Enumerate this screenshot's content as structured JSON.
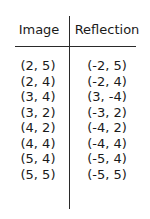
{
  "table": {
    "headers": [
      "Image",
      "Reflection"
    ],
    "rows": [
      {
        "image": "(2, 5)",
        "reflection": "(-2, 5)"
      },
      {
        "image": "(2, 4)",
        "reflection": "(-2, 4)"
      },
      {
        "image": "(3, 4)",
        "reflection": "(3, -4)"
      },
      {
        "image": "(3, 2)",
        "reflection": "(-3, 2)"
      },
      {
        "image": "(4, 2)",
        "reflection": "(-4, 2)"
      },
      {
        "image": "(4, 4)",
        "reflection": "(-4, 4)"
      },
      {
        "image": "(5, 4)",
        "reflection": "(-5, 4)"
      },
      {
        "image": "(5, 5)",
        "reflection": "(-5, 5)"
      }
    ]
  }
}
